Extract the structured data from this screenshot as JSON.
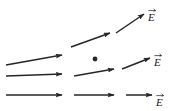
{
  "figure": {
    "background_color": "#ffffff",
    "stroke_color": "#262626",
    "width": 172,
    "height": 111
  },
  "chart_data": {
    "type": "scatter",
    "title": "",
    "xlabel": "",
    "ylabel": "",
    "xlim": [
      0,
      172
    ],
    "ylim": [
      0,
      111
    ],
    "grid": false,
    "legend": false,
    "arrows": [
      {
        "id": "row1-seg1",
        "x1": 6,
        "y1": 65,
        "x2": 62,
        "y2": 55,
        "label": ""
      },
      {
        "id": "row1-seg2",
        "x1": 71,
        "y1": 47,
        "x2": 110,
        "y2": 33,
        "label": ""
      },
      {
        "id": "row1-seg3",
        "x1": 116,
        "y1": 33,
        "x2": 144,
        "y2": 14,
        "label": "E"
      },
      {
        "id": "row2-seg1",
        "x1": 6,
        "y1": 76,
        "x2": 62,
        "y2": 74,
        "label": ""
      },
      {
        "id": "row2-seg2",
        "x1": 74,
        "y1": 76,
        "x2": 114,
        "y2": 69,
        "label": ""
      },
      {
        "id": "row2-seg3",
        "x1": 122,
        "y1": 69,
        "x2": 150,
        "y2": 58,
        "label": "E"
      },
      {
        "id": "row3-seg1",
        "x1": 6,
        "y1": 95,
        "x2": 62,
        "y2": 95,
        "label": ""
      },
      {
        "id": "row3-seg2",
        "x1": 74,
        "y1": 95,
        "x2": 114,
        "y2": 95,
        "label": ""
      },
      {
        "id": "row3-seg3",
        "x1": 126,
        "y1": 95,
        "x2": 152,
        "y2": 95,
        "label": "E"
      }
    ],
    "points": [
      {
        "id": "charge-point",
        "x": 95,
        "y": 59,
        "radius": 2.4
      }
    ]
  },
  "labels": {
    "field_top": {
      "text": "E",
      "x": 148,
      "y": 12
    },
    "field_middle": {
      "text": "E",
      "x": 154,
      "y": 57
    },
    "field_bottom": {
      "text": "E",
      "x": 156,
      "y": 97
    }
  }
}
